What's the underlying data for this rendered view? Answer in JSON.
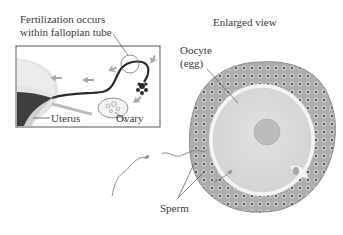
{
  "labels": {
    "inset_title_line1": "Fertilization occurs",
    "inset_title_line2": "within fallopian tube",
    "enlarged_view": "Enlarged view",
    "oocyte_line1": "Oocyte",
    "oocyte_line2": "(egg)",
    "uterus": "Uterus",
    "ovary": "Ovary",
    "sperm": "Sperm"
  },
  "colors": {
    "inset_border": "#555555",
    "uterus_fill": "#d9d9d9",
    "uterus_dark": "#3a3a3a",
    "tube_dark": "#2a2a2a",
    "arrow": "#a8a8a8",
    "corona_cells": "#a9a9a9",
    "cell_nuclei": "#333333",
    "zona": "#f4f4f4",
    "cytoplasm": "#dcdcdc",
    "nucleus": "#bdbdbd"
  }
}
